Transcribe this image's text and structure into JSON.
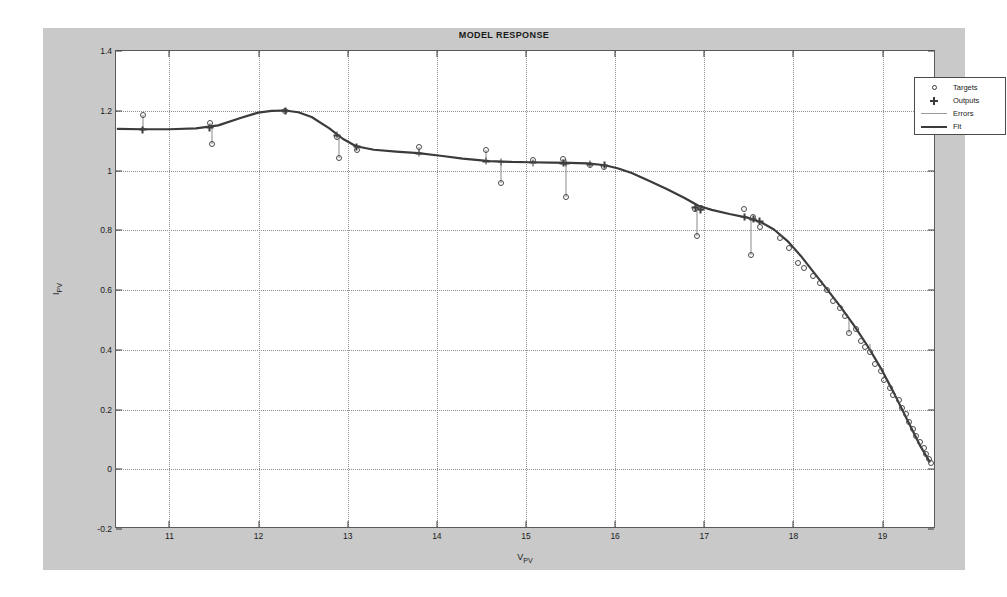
{
  "figure": {
    "title": "MODEL RESPONSE",
    "background_color": "#c9c9c9",
    "axes_background": "#ffffff",
    "page_background": "#ffffff"
  },
  "legend": {
    "position": "top-right",
    "entries": [
      {
        "label": "Targets",
        "symbol": "circle-marker",
        "color": "#4a4a4a"
      },
      {
        "label": "Outputs",
        "symbol": "plus-marker",
        "color": "#3d3d3d"
      },
      {
        "label": "Errors",
        "symbol": "thin-line",
        "color": "#9a9a9a"
      },
      {
        "label": "Fit",
        "symbol": "thick-line",
        "color": "#3b3b3b"
      }
    ]
  },
  "chart_data": {
    "type": "scatter",
    "title": "MODEL RESPONSE",
    "xlabel": "V_PV",
    "xlabel_base": "V",
    "xlabel_sub": "PV",
    "ylabel": "I_PV",
    "ylabel_base": "I",
    "ylabel_sub": "PV",
    "grid": true,
    "xlim": [
      10.4,
      19.6
    ],
    "ylim": [
      -0.2,
      1.4
    ],
    "xticks": [
      11,
      12,
      13,
      14,
      15,
      16,
      17,
      18,
      19
    ],
    "yticks": [
      -0.2,
      0,
      0.2,
      0.4,
      0.6,
      0.8,
      1,
      1.2,
      1.4
    ],
    "xtick_labels": [
      "11",
      "12",
      "13",
      "14",
      "15",
      "16",
      "17",
      "18",
      "19"
    ],
    "ytick_labels": [
      "-0.2",
      "0",
      "0.2",
      "0.4",
      "0.6",
      "0.8",
      "1",
      "1.2",
      "1.4"
    ],
    "series": [
      {
        "name": "Fit",
        "type": "line",
        "color": "#3b3b3b",
        "x": [
          10.42,
          10.7,
          11.0,
          11.3,
          11.55,
          11.8,
          12.0,
          12.15,
          12.3,
          12.45,
          12.6,
          12.8,
          12.95,
          13.1,
          13.3,
          13.55,
          13.8,
          14.05,
          14.3,
          14.6,
          14.85,
          15.05,
          15.3,
          15.5,
          15.7,
          15.9,
          16.05,
          16.2,
          16.4,
          16.6,
          16.8,
          16.95,
          17.1,
          17.3,
          17.5,
          17.65,
          17.8,
          17.95,
          18.1,
          18.25,
          18.4,
          18.55,
          18.7,
          18.85,
          19.0,
          19.15,
          19.3,
          19.45,
          19.55
        ],
        "y": [
          1.138,
          1.137,
          1.137,
          1.14,
          1.15,
          1.175,
          1.193,
          1.199,
          1.2,
          1.194,
          1.178,
          1.14,
          1.105,
          1.08,
          1.068,
          1.062,
          1.057,
          1.048,
          1.038,
          1.03,
          1.027,
          1.026,
          1.025,
          1.024,
          1.022,
          1.016,
          1.005,
          0.99,
          0.963,
          0.935,
          0.905,
          0.88,
          0.866,
          0.852,
          0.84,
          0.825,
          0.8,
          0.762,
          0.712,
          0.655,
          0.598,
          0.54,
          0.478,
          0.41,
          0.335,
          0.25,
          0.16,
          0.07,
          0.02
        ]
      },
      {
        "name": "Targets",
        "type": "scatter-circle",
        "color": "#4a4a4a",
        "points": [
          {
            "x": 10.7,
            "y": 1.185
          },
          {
            "x": 11.45,
            "y": 1.158
          },
          {
            "x": 11.48,
            "y": 1.09
          },
          {
            "x": 12.3,
            "y": 1.2
          },
          {
            "x": 12.88,
            "y": 1.112
          },
          {
            "x": 12.9,
            "y": 1.042
          },
          {
            "x": 13.1,
            "y": 1.07
          },
          {
            "x": 13.8,
            "y": 1.078
          },
          {
            "x": 14.55,
            "y": 1.068
          },
          {
            "x": 14.72,
            "y": 0.958
          },
          {
            "x": 15.08,
            "y": 1.035
          },
          {
            "x": 15.42,
            "y": 1.04
          },
          {
            "x": 15.45,
            "y": 0.91
          },
          {
            "x": 15.72,
            "y": 1.018
          },
          {
            "x": 15.88,
            "y": 1.012
          },
          {
            "x": 16.9,
            "y": 0.872
          },
          {
            "x": 16.96,
            "y": 0.875
          },
          {
            "x": 16.92,
            "y": 0.782
          },
          {
            "x": 17.45,
            "y": 0.87
          },
          {
            "x": 17.55,
            "y": 0.845
          },
          {
            "x": 17.52,
            "y": 0.718
          },
          {
            "x": 17.62,
            "y": 0.812
          },
          {
            "x": 17.85,
            "y": 0.775
          },
          {
            "x": 17.95,
            "y": 0.742
          },
          {
            "x": 18.05,
            "y": 0.69
          },
          {
            "x": 18.12,
            "y": 0.672
          },
          {
            "x": 18.22,
            "y": 0.648
          },
          {
            "x": 18.3,
            "y": 0.622
          },
          {
            "x": 18.38,
            "y": 0.6
          },
          {
            "x": 18.44,
            "y": 0.562
          },
          {
            "x": 18.52,
            "y": 0.54
          },
          {
            "x": 18.58,
            "y": 0.512
          },
          {
            "x": 18.62,
            "y": 0.455
          },
          {
            "x": 18.7,
            "y": 0.47
          },
          {
            "x": 18.76,
            "y": 0.43
          },
          {
            "x": 18.8,
            "y": 0.408
          },
          {
            "x": 18.86,
            "y": 0.392
          },
          {
            "x": 18.92,
            "y": 0.352
          },
          {
            "x": 18.98,
            "y": 0.33
          },
          {
            "x": 19.02,
            "y": 0.298
          },
          {
            "x": 19.08,
            "y": 0.272
          },
          {
            "x": 19.12,
            "y": 0.25
          },
          {
            "x": 19.18,
            "y": 0.232
          },
          {
            "x": 19.22,
            "y": 0.205
          },
          {
            "x": 19.26,
            "y": 0.185
          },
          {
            "x": 19.3,
            "y": 0.158
          },
          {
            "x": 19.34,
            "y": 0.135
          },
          {
            "x": 19.38,
            "y": 0.112
          },
          {
            "x": 19.42,
            "y": 0.092
          },
          {
            "x": 19.46,
            "y": 0.072
          },
          {
            "x": 19.49,
            "y": 0.052
          },
          {
            "x": 19.52,
            "y": 0.035
          },
          {
            "x": 19.54,
            "y": 0.022
          }
        ]
      },
      {
        "name": "Outputs",
        "type": "scatter-plus",
        "color": "#3d3d3d",
        "points": [
          {
            "x": 10.7,
            "y": 1.137
          },
          {
            "x": 11.45,
            "y": 1.143
          },
          {
            "x": 12.3,
            "y": 1.2
          },
          {
            "x": 12.88,
            "y": 1.118
          },
          {
            "x": 13.1,
            "y": 1.08
          },
          {
            "x": 13.8,
            "y": 1.057
          },
          {
            "x": 14.55,
            "y": 1.031
          },
          {
            "x": 14.72,
            "y": 1.028
          },
          {
            "x": 15.08,
            "y": 1.026
          },
          {
            "x": 15.42,
            "y": 1.024
          },
          {
            "x": 15.45,
            "y": 1.024
          },
          {
            "x": 15.72,
            "y": 1.021
          },
          {
            "x": 15.88,
            "y": 1.017
          },
          {
            "x": 16.9,
            "y": 0.876
          },
          {
            "x": 16.96,
            "y": 0.869
          },
          {
            "x": 17.45,
            "y": 0.844
          },
          {
            "x": 17.55,
            "y": 0.836
          },
          {
            "x": 17.62,
            "y": 0.83
          }
        ]
      }
    ],
    "errors": [
      {
        "x": 10.7,
        "y_target": 1.185,
        "y_output": 1.137
      },
      {
        "x": 11.45,
        "y_target": 1.158,
        "y_output": 1.143
      },
      {
        "x": 11.48,
        "y_target": 1.09,
        "y_output": 1.143
      },
      {
        "x": 12.88,
        "y_target": 1.112,
        "y_output": 1.118
      },
      {
        "x": 12.9,
        "y_target": 1.042,
        "y_output": 1.118
      },
      {
        "x": 13.8,
        "y_target": 1.078,
        "y_output": 1.057
      },
      {
        "x": 14.55,
        "y_target": 1.068,
        "y_output": 1.031
      },
      {
        "x": 14.72,
        "y_target": 0.958,
        "y_output": 1.028
      },
      {
        "x": 15.08,
        "y_target": 1.035,
        "y_output": 1.026
      },
      {
        "x": 15.42,
        "y_target": 1.04,
        "y_output": 1.024
      },
      {
        "x": 15.45,
        "y_target": 0.91,
        "y_output": 1.024
      },
      {
        "x": 15.72,
        "y_target": 1.018,
        "y_output": 1.021
      },
      {
        "x": 16.92,
        "y_target": 0.782,
        "y_output": 0.874
      },
      {
        "x": 17.52,
        "y_target": 0.718,
        "y_output": 0.84
      },
      {
        "x": 18.62,
        "y_target": 0.455,
        "y_output": 0.5
      },
      {
        "x": 18.86,
        "y_target": 0.392,
        "y_output": 0.42
      }
    ]
  }
}
